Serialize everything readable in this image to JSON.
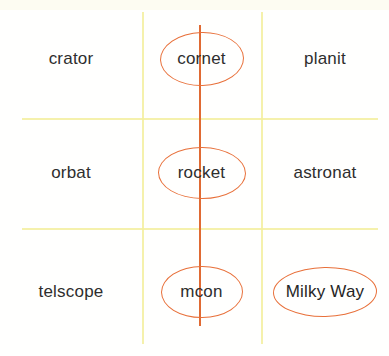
{
  "worksheet": {
    "title": "Space vocabulary grid",
    "grid": {
      "rows": 3,
      "columns": 3,
      "line_color": "#f3ee9e",
      "annotation_color": "#e8703a",
      "text_color": "#2e2e2e"
    },
    "cells": [
      {
        "row": 1,
        "col": 1,
        "text": "crator",
        "circled": false
      },
      {
        "row": 1,
        "col": 2,
        "text": "cornet",
        "circled": true
      },
      {
        "row": 1,
        "col": 3,
        "text": "planit",
        "circled": false
      },
      {
        "row": 2,
        "col": 1,
        "text": "orbat",
        "circled": false
      },
      {
        "row": 2,
        "col": 2,
        "text": "rocket",
        "circled": true
      },
      {
        "row": 2,
        "col": 3,
        "text": "astronat",
        "circled": false
      },
      {
        "row": 3,
        "col": 1,
        "text": "telscope",
        "circled": false
      },
      {
        "row": 3,
        "col": 2,
        "text": "mcon",
        "circled": true
      },
      {
        "row": 3,
        "col": 3,
        "text": "Milky Way",
        "circled": true
      }
    ],
    "annotations": {
      "center_column_stroke": "vertical orange line drawn down the middle column"
    }
  }
}
